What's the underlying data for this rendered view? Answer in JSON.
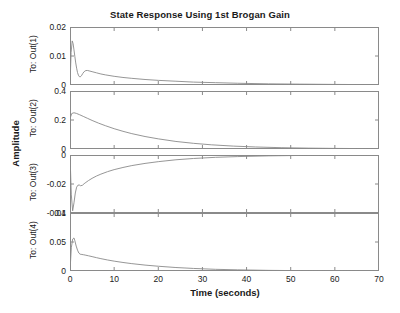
{
  "chart_data": {
    "type": "line",
    "title": "State Response Using 1st Brogan Gain",
    "xlabel": "Time (seconds)",
    "ylabel": "Amplitude",
    "xlim": [
      0,
      70
    ],
    "xticks": [
      0,
      10,
      20,
      30,
      40,
      50,
      60,
      70
    ],
    "grid": false,
    "legend": null,
    "line_color": "#8a8a8a",
    "subplots": [
      {
        "name": "To: Out(1)",
        "ylim": [
          0,
          0.02
        ],
        "yticks": [
          0,
          0.01,
          0.02
        ],
        "ytick_labels": [
          "0",
          "0.01",
          "0.02"
        ],
        "x": [
          0,
          0.25,
          0.5,
          0.7,
          0.9,
          1.1,
          1.3,
          1.5,
          1.7,
          1.9,
          2.1,
          2.3,
          2.6,
          2.9,
          3.2,
          3.6,
          4,
          4.5,
          5,
          6,
          7,
          8,
          10,
          12,
          14,
          17,
          20,
          24,
          28,
          33,
          38,
          45,
          52,
          60,
          70
        ],
        "y": [
          0,
          0.0112,
          0.0152,
          0.0143,
          0.0121,
          0.0098,
          0.0076,
          0.0058,
          0.0043,
          0.0034,
          0.0029,
          0.0028,
          0.0032,
          0.004,
          0.0046,
          0.005,
          0.005,
          0.0048,
          0.0046,
          0.0042,
          0.0038,
          0.0035,
          0.003,
          0.0026,
          0.0023,
          0.0019,
          0.0016,
          0.0013,
          0.001,
          0.0008,
          0.0006,
          0.0004,
          0.0003,
          0.0002,
          0.0001
        ]
      },
      {
        "name": "To: Out(2)",
        "ylim": [
          0,
          0.4
        ],
        "yticks": [
          0,
          0.2,
          0.4
        ],
        "ytick_labels": [
          "0",
          "0.2",
          "0.4"
        ],
        "x": [
          0,
          0.4,
          0.9,
          1.5,
          2.2,
          3,
          4,
          5,
          6.5,
          8,
          10,
          12,
          14,
          17,
          20,
          24,
          28,
          32,
          37,
          42,
          48,
          54,
          60,
          65,
          70
        ],
        "y": [
          0.21,
          0.245,
          0.25,
          0.245,
          0.236,
          0.225,
          0.211,
          0.197,
          0.178,
          0.161,
          0.14,
          0.122,
          0.106,
          0.086,
          0.07,
          0.052,
          0.039,
          0.029,
          0.02,
          0.014,
          0.009,
          0.006,
          0.004,
          0.003,
          0.002
        ]
      },
      {
        "name": "To: Out(3)",
        "ylim": [
          -0.04,
          0
        ],
        "yticks": [
          -0.04,
          -0.02,
          0
        ],
        "ytick_labels": [
          "-0.04",
          "-0.02",
          "0"
        ],
        "x": [
          0,
          0.3,
          0.6,
          0.9,
          1.2,
          1.5,
          1.8,
          2.1,
          2.4,
          2.8,
          3.2,
          3.6,
          4.2,
          5,
          6,
          7,
          8.5,
          10,
          12,
          14,
          17,
          20,
          24,
          28,
          33,
          38,
          45,
          52,
          60,
          70
        ],
        "y": [
          0,
          -0.0275,
          -0.0385,
          -0.033,
          -0.0262,
          -0.0222,
          -0.0208,
          -0.0207,
          -0.0212,
          -0.0209,
          -0.0198,
          -0.0189,
          -0.0176,
          -0.0161,
          -0.0145,
          -0.0132,
          -0.0115,
          -0.0101,
          -0.0086,
          -0.0073,
          -0.0058,
          -0.0046,
          -0.0033,
          -0.0024,
          -0.0016,
          -0.0011,
          -0.0006,
          -0.0003,
          -0.0002,
          -0.0001
        ]
      },
      {
        "name": "To: Out(4)",
        "ylim": [
          0,
          0.1
        ],
        "yticks": [
          0,
          0.05,
          0.1
        ],
        "ytick_labels": [
          "0",
          "0.05",
          "0.1"
        ],
        "x": [
          0,
          0.3,
          0.6,
          0.9,
          1.1,
          1.4,
          1.7,
          2,
          2.3,
          2.7,
          3.1,
          3.6,
          4.2,
          5,
          6,
          7,
          8.5,
          10,
          12,
          14,
          17,
          20,
          24,
          28,
          33,
          38,
          45,
          52,
          60,
          70
        ],
        "y": [
          0,
          0.04,
          0.055,
          0.057,
          0.052,
          0.043,
          0.036,
          0.031,
          0.029,
          0.0285,
          0.028,
          0.0272,
          0.0262,
          0.0248,
          0.023,
          0.0213,
          0.019,
          0.017,
          0.0147,
          0.0127,
          0.0102,
          0.0082,
          0.006,
          0.0044,
          0.0029,
          0.002,
          0.0011,
          0.0006,
          0.0003,
          0.0001
        ]
      }
    ]
  }
}
